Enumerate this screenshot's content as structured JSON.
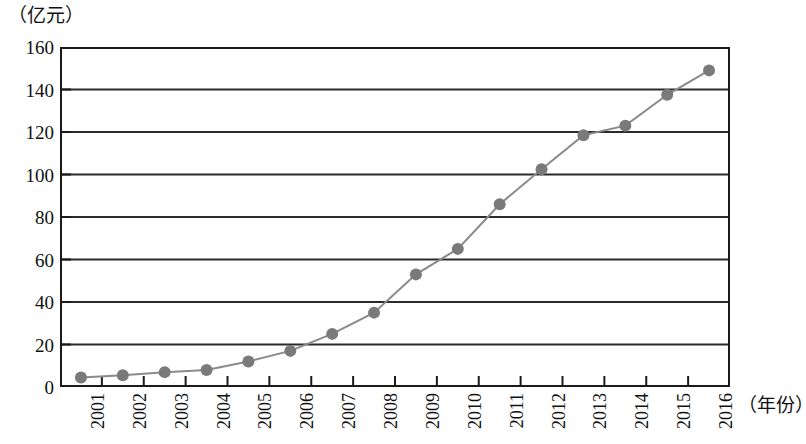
{
  "chart_data": {
    "type": "line",
    "title": "",
    "subtitle": "",
    "xlabel": "（年份）",
    "ylabel": "（亿元）",
    "categories": [
      "2001",
      "2002",
      "2003",
      "2004",
      "2005",
      "2006",
      "2007",
      "2008",
      "2009",
      "2010",
      "2011",
      "2012",
      "2013",
      "2014",
      "2015",
      "2016"
    ],
    "values": [
      4.5,
      5.5,
      7,
      8,
      12,
      17,
      25,
      35,
      53,
      65,
      86,
      102.5,
      118.5,
      123,
      137.5,
      149
    ],
    "series": [
      {
        "name": "",
        "values": [
          4.5,
          5.5,
          7,
          8,
          12,
          17,
          25,
          35,
          53,
          65,
          86,
          102.5,
          118.5,
          123,
          137.5,
          149
        ]
      }
    ],
    "ylim": [
      0,
      160
    ],
    "y_ticks": [
      0,
      20,
      40,
      60,
      80,
      100,
      120,
      140,
      160
    ],
    "y_tick_labels": [
      "0",
      "20",
      "40",
      "60",
      "80",
      "100",
      "120",
      "140",
      "160"
    ],
    "grid": "horizontal",
    "legend": "none",
    "marker": "circle",
    "marker_color": "#7a7a7a",
    "line_color": "#8a8a8a",
    "axis_color": "#1a1a1a",
    "grid_color": "#2b2b2b",
    "background": "#ffffff"
  },
  "axes": {
    "y_unit_caption": "（亿元）",
    "x_unit_caption": "（年份）"
  }
}
